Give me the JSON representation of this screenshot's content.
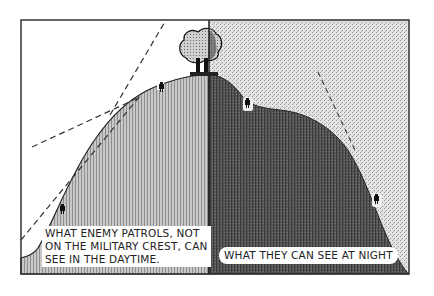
{
  "figure": {
    "panels": [
      {
        "id": "day",
        "caption_lines": [
          "WHAT ENEMY PATROLS, NOT",
          "ON THE MILITARY CREST, CAN",
          "SEE IN THE DAYTIME."
        ]
      },
      {
        "id": "night",
        "caption": "WHAT THEY CAN SEE AT NIGHT"
      }
    ],
    "colors": {
      "frame": "#333333",
      "day_sky": "#ffffff",
      "day_hill": "#b5b5b5",
      "night_sky": "#d9d9d9",
      "night_hill": "#4a4a4a",
      "sight_line": "#333333"
    },
    "icons": [
      "tree-icon",
      "soldier-icon"
    ]
  }
}
